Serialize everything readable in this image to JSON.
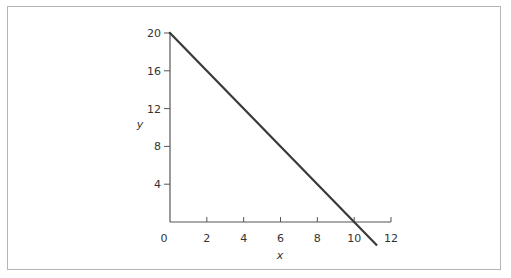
{
  "chart_data": {
    "type": "line",
    "title": "",
    "xlabel": "x",
    "ylabel": "y",
    "xlim": [
      0,
      12
    ],
    "ylim": [
      0,
      20
    ],
    "x_ticks": [
      0,
      2,
      4,
      6,
      8,
      10,
      12
    ],
    "y_ticks": [
      4,
      8,
      12,
      16,
      20
    ],
    "grid": false,
    "legend": null,
    "series": [
      {
        "name": "line",
        "x": [
          0,
          10,
          11.2
        ],
        "y": [
          20,
          0,
          -2.4
        ],
        "color": "#3a3a3a",
        "equation": "y = 20 - 2x"
      }
    ]
  },
  "colors": {
    "axis": "#555555",
    "line": "#3a3a3a",
    "frame": "#b5b5b5",
    "text": "#333333"
  }
}
